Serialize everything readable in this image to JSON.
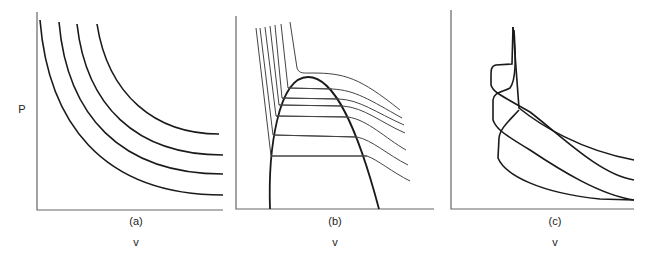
{
  "figure": {
    "y_axis_label": "P",
    "panels": [
      {
        "id": "a",
        "caption": "(a)",
        "x_axis_label": "v",
        "description": "ideal-gas isotherms (hyperbolas)"
      },
      {
        "id": "b",
        "caption": "(b)",
        "x_axis_label": "v",
        "description": "real-gas isotherms with vapor dome and tie lines"
      },
      {
        "id": "c",
        "caption": "(c)",
        "x_axis_label": "v",
        "description": "van der Waals-type looping isotherms"
      }
    ],
    "colors": {
      "curve": "#1a1a1a",
      "axis": "#555555",
      "thin_curve": "#444444"
    }
  }
}
